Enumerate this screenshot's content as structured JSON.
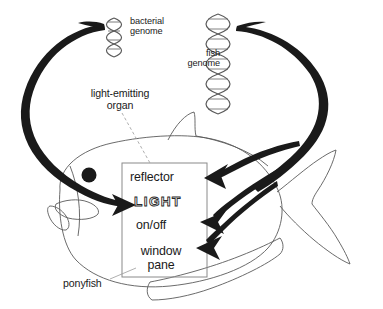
{
  "figure": {
    "subject": "ponyfish",
    "colors": {
      "background": "#ffffff",
      "outline": "#555555",
      "arrow": "#1a1a1a",
      "text": "#1a1a1a",
      "helix": "#555555",
      "box_border": "#777777",
      "eye": "#1a1a1a"
    }
  },
  "labels": {
    "bacterial_genome": "bacterial\ngenome",
    "fish_genome": "fish\ngenome",
    "light_emitting_organ": "light-emitting\norgan",
    "ponyfish": "ponyfish"
  },
  "organ_box": {
    "components": [
      {
        "name": "reflector",
        "label": "reflector",
        "source": "fish genome"
      },
      {
        "name": "light",
        "label": "LIGHT",
        "source": "bacterial genome",
        "style": "outline"
      },
      {
        "name": "on_off",
        "label": "on/off",
        "source": "fish genome"
      },
      {
        "name": "window_pane",
        "label": "window\npane",
        "source": "fish genome"
      }
    ]
  },
  "arrows": [
    {
      "from": "bacterial genome",
      "to": "LIGHT",
      "style": "thick-curved"
    },
    {
      "from": "fish genome",
      "to": "reflector",
      "style": "thick-curved"
    },
    {
      "from": "fish genome",
      "to": "on/off",
      "style": "thick-curved"
    },
    {
      "from": "fish genome",
      "to": "window pane",
      "style": "thick-curved"
    }
  ],
  "genomes": [
    {
      "name": "bacterial genome",
      "helix": "small",
      "turns": 5
    },
    {
      "name": "fish genome",
      "helix": "large",
      "turns": 11
    }
  ]
}
